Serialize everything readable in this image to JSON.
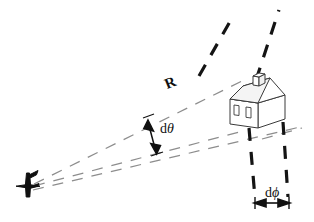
{
  "figure": {
    "background_color": "#ffffff",
    "width": 314,
    "height": 222,
    "labels": {
      "range": "R",
      "elevation_beamwidth_prefix": "d",
      "elevation_beamwidth_symbol": "θ",
      "azimuth_beamwidth_prefix": "d",
      "azimuth_beamwidth_symbol": "ϕ"
    },
    "colors": {
      "beam_ray": "#8d8d8d",
      "beam_edge": "#1a1a1a",
      "outline": "#3a3a3a",
      "house_fill": "#ffffff",
      "house_shade": "#f2f2f2",
      "antenna": "#101010",
      "text": "#111111"
    },
    "elements": {
      "antenna_name": "radar-antenna",
      "target_name": "house-target",
      "ray_count": 3,
      "beam_edge_count": 4
    }
  }
}
